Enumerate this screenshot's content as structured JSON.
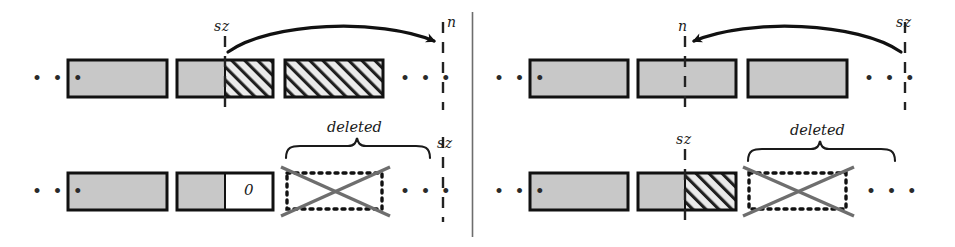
{
  "figure": {
    "kind": "two-panel-array-diagram",
    "divider": {
      "x": 472,
      "y1": 12,
      "y2": 237
    },
    "colors": {
      "gray_fill": "#c8c8c8",
      "hatch_fill": "#ebebeb",
      "hatch_stroke": "#1a1a1a",
      "outline": "#111111",
      "dotted": "#111111",
      "cross": "#6e6e6e",
      "ink": "#1a1a1a",
      "background": "#ffffff"
    },
    "ellipsis_glyph": "• • •"
  },
  "panels": [
    {
      "name": "left-panel-insert",
      "rows": [
        {
          "name": "top-row",
          "ellipsis_left": "• • •",
          "ellipsis_right": "• • •",
          "marker_left": {
            "label": "sz",
            "x": 223
          },
          "marker_right": {
            "label": "n",
            "x": 443
          },
          "arrow": {
            "from": "sz",
            "to": "n",
            "direction": "right"
          },
          "blocks": [
            {
              "name": "block-1",
              "x": 68,
              "w": 99,
              "fill": "gray",
              "split": null
            },
            {
              "name": "block-2",
              "x": 177,
              "w": 96,
              "fill": "split",
              "split": 48,
              "left_fill": "gray",
              "right_fill": "hatch"
            },
            {
              "name": "block-3",
              "x": 285,
              "w": 98,
              "fill": "hatch",
              "split": null
            }
          ]
        },
        {
          "name": "bottom-row",
          "ellipsis_left": "• • •",
          "ellipsis_right": "• • •",
          "marker_right": {
            "label": "sz",
            "x": 443
          },
          "brace": {
            "label": "deleted",
            "x1": 285,
            "x2": 430
          },
          "blocks": [
            {
              "name": "block-1",
              "x": 68,
              "w": 99,
              "fill": "gray",
              "split": null
            },
            {
              "name": "block-2",
              "x": 177,
              "w": 96,
              "fill": "split",
              "split": 48,
              "left_fill": "gray",
              "right_fill": "white",
              "right_label": "0"
            },
            {
              "name": "block-3-deleted",
              "x": 286,
              "w": 97,
              "fill": "dotted-crossed",
              "split": null
            }
          ]
        }
      ]
    },
    {
      "name": "right-panel-delete",
      "rows": [
        {
          "name": "top-row",
          "ellipsis_left": "• • •",
          "ellipsis_right": "• • •",
          "marker_left": {
            "label": "n",
            "x": 685
          },
          "marker_right": {
            "label": "sz",
            "x": 905
          },
          "arrow": {
            "from": "sz",
            "to": "n",
            "direction": "left"
          },
          "blocks": [
            {
              "name": "block-1",
              "x": 530,
              "w": 98,
              "fill": "gray",
              "split": null
            },
            {
              "name": "block-2",
              "x": 638,
              "w": 98,
              "fill": "gray",
              "split": 47
            },
            {
              "name": "block-3",
              "x": 748,
              "w": 99,
              "fill": "gray",
              "split": null
            }
          ]
        },
        {
          "name": "bottom-row",
          "ellipsis_left": "• • •",
          "ellipsis_right": "• • •",
          "marker_left": {
            "label": "sz",
            "x": 685
          },
          "brace": {
            "label": "deleted",
            "x1": 748,
            "x2": 895
          },
          "blocks": [
            {
              "name": "block-1",
              "x": 530,
              "w": 98,
              "fill": "gray",
              "split": null
            },
            {
              "name": "block-2",
              "x": 638,
              "w": 98,
              "fill": "split",
              "split": 47,
              "left_fill": "gray",
              "right_fill": "hatch"
            },
            {
              "name": "block-3-deleted",
              "x": 748,
              "w": 99,
              "fill": "dotted-crossed",
              "split": null
            }
          ]
        }
      ]
    }
  ],
  "labels": {
    "left_top_sz": "sz",
    "left_top_n": "n",
    "left_bottom_sz": "sz",
    "left_bottom_deleted": "deleted",
    "left_bottom_zero": "0",
    "right_top_n": "n",
    "right_top_sz": "sz",
    "right_bottom_sz": "sz",
    "right_bottom_deleted": "deleted",
    "ellipsis": "• • •"
  }
}
